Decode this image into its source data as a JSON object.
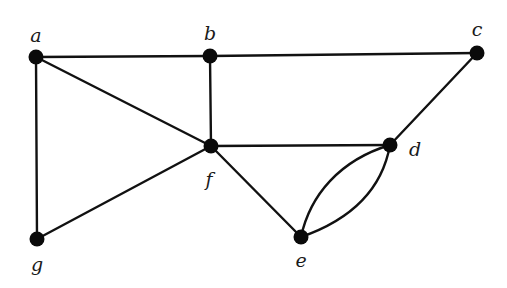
{
  "diagram": {
    "type": "undirected-multigraph",
    "colors": {
      "edge": "#111111",
      "node": "#0a0a0a",
      "label": "#1a1a1a",
      "background": "#ffffff"
    },
    "nodes": [
      {
        "id": "a",
        "label": "a",
        "x": 36,
        "y": 57,
        "lx": 36,
        "ly": 42
      },
      {
        "id": "b",
        "label": "b",
        "x": 210,
        "y": 56,
        "lx": 210,
        "ly": 40
      },
      {
        "id": "c",
        "label": "c",
        "x": 477,
        "y": 53,
        "lx": 477,
        "ly": 36
      },
      {
        "id": "d",
        "label": "d",
        "x": 390,
        "y": 145,
        "lx": 415,
        "ly": 156
      },
      {
        "id": "e",
        "label": "e",
        "x": 301,
        "y": 237,
        "lx": 301,
        "ly": 267
      },
      {
        "id": "f",
        "label": "f",
        "x": 211,
        "y": 146,
        "lx": 209,
        "ly": 186
      },
      {
        "id": "g",
        "label": "g",
        "x": 37,
        "y": 239,
        "lx": 37,
        "ly": 271
      }
    ],
    "edges": [
      {
        "from": "a",
        "to": "b"
      },
      {
        "from": "b",
        "to": "c"
      },
      {
        "from": "a",
        "to": "f"
      },
      {
        "from": "a",
        "to": "g"
      },
      {
        "from": "b",
        "to": "f"
      },
      {
        "from": "c",
        "to": "d"
      },
      {
        "from": "f",
        "to": "d"
      },
      {
        "from": "f",
        "to": "e"
      },
      {
        "from": "f",
        "to": "g"
      },
      {
        "from": "e",
        "to": "d",
        "curve": "left"
      },
      {
        "from": "e",
        "to": "d",
        "curve": "right"
      }
    ]
  }
}
